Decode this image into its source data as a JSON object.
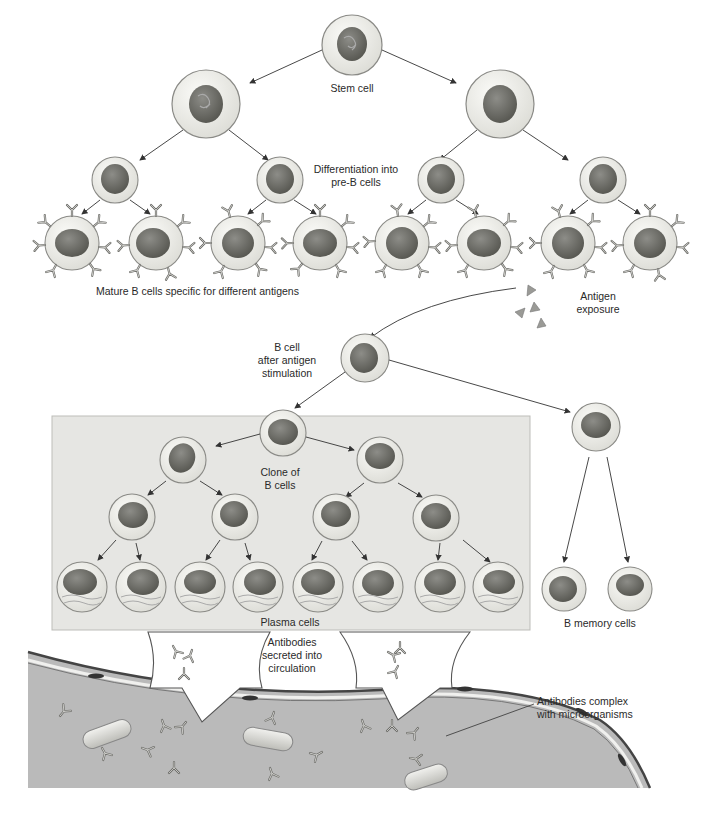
{
  "figure": {
    "type": "diagram"
  },
  "labels": {
    "stem_cell": "Stem cell",
    "differentiation": [
      "Differentiation into",
      "pre-B cells"
    ],
    "mature_b_cells": "Mature B cells specific for different antigens",
    "antigen_exposure": [
      "Antigen",
      "exposure"
    ],
    "b_cell_after_stimulation": [
      "B cell",
      "after antigen",
      "stimulation"
    ],
    "clone_of_b_cells": [
      "Clone of",
      "B cells"
    ],
    "plasma_cells": "Plasma cells",
    "b_memory_cells": "B memory cells",
    "antibodies_secreted": [
      "Antibodies",
      "secreted into",
      "circulation"
    ],
    "antibodies_complex": [
      "Antibodies complex",
      "with microorganisms"
    ]
  },
  "colors": {
    "cell_fill": "#efefea",
    "cell_outline": "#8a8a86",
    "nucleus": "#6e6e6a",
    "box_fill": "#e8e8e6",
    "vessel_fill": "#b9b9b6",
    "arrow": "#333333"
  }
}
